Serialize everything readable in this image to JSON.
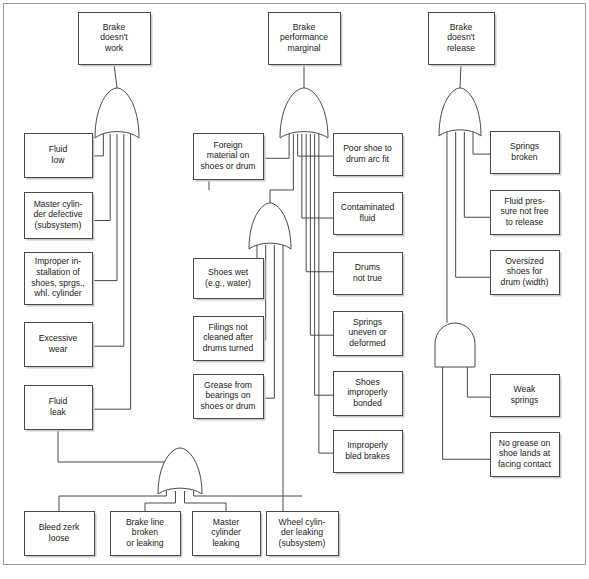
{
  "diagram": {
    "type": "fault-tree",
    "line_color": "#4a4a4a",
    "box_fill": "#ffffff",
    "shadow_color": "#c9c9c9",
    "frame_color": "#9a9a9a"
  },
  "nodes": {
    "top_left": {
      "lines": [
        "Brake",
        "doesn't",
        "work"
      ],
      "x": 78,
      "y": 12,
      "w": 72,
      "h": 52
    },
    "top_mid": {
      "lines": [
        "Brake",
        "performance",
        "marginal"
      ],
      "x": 268,
      "y": 12,
      "w": 72,
      "h": 52
    },
    "top_right": {
      "lines": [
        "Brake",
        "doesn't",
        "release"
      ],
      "x": 428,
      "y": 12,
      "w": 66,
      "h": 52
    },
    "fluid_low": {
      "lines": [
        "Fluid",
        "low"
      ],
      "x": 24,
      "y": 133,
      "w": 68,
      "h": 44
    },
    "master_cyl_defective": {
      "lines": [
        "Master cylin-",
        "der defective",
        "(subsystem)"
      ],
      "x": 24,
      "y": 192,
      "w": 68,
      "h": 46
    },
    "improper_install": {
      "lines": [
        "Improper in-",
        "stallation of",
        "shoes, sprgs.,",
        "whl. cylinder"
      ],
      "x": 24,
      "y": 252,
      "w": 68,
      "h": 52
    },
    "excessive_wear": {
      "lines": [
        "Excessive",
        "wear"
      ],
      "x": 24,
      "y": 322,
      "w": 68,
      "h": 44
    },
    "fluid_leak": {
      "lines": [
        "Fluid",
        "leak"
      ],
      "x": 24,
      "y": 385,
      "w": 68,
      "h": 44
    },
    "foreign_material": {
      "lines": [
        "Foreign",
        "material on",
        "shoes or drum"
      ],
      "x": 193,
      "y": 133,
      "w": 70,
      "h": 46
    },
    "shoes_wet": {
      "lines": [
        "Shoes wet",
        "(e.g., water)"
      ],
      "x": 193,
      "y": 258,
      "w": 70,
      "h": 40
    },
    "filings_not_cleaned": {
      "lines": [
        "Filings not",
        "cleaned after",
        "drums turned"
      ],
      "x": 193,
      "y": 316,
      "w": 70,
      "h": 44
    },
    "grease_bearings": {
      "lines": [
        "Grease from",
        "bearings on",
        "shoes or drum"
      ],
      "x": 193,
      "y": 374,
      "w": 70,
      "h": 44
    },
    "poor_shoe_arc": {
      "lines": [
        "Poor shoe to",
        "drum arc fit"
      ],
      "x": 333,
      "y": 133,
      "w": 69,
      "h": 42
    },
    "contaminated_fluid": {
      "lines": [
        "Contaminated",
        "fluid"
      ],
      "x": 333,
      "y": 192,
      "w": 69,
      "h": 42
    },
    "drums_not_true": {
      "lines": [
        "Drums",
        "not true"
      ],
      "x": 333,
      "y": 252,
      "w": 69,
      "h": 42
    },
    "springs_uneven": {
      "lines": [
        "Springs",
        "uneven or",
        "deformed"
      ],
      "x": 333,
      "y": 311,
      "w": 69,
      "h": 44
    },
    "shoes_improperly_bonded": {
      "lines": [
        "Shoes",
        "improperly",
        "bonded"
      ],
      "x": 333,
      "y": 371,
      "w": 69,
      "h": 44
    },
    "improperly_bled": {
      "lines": [
        "Improperly",
        "bled brakes"
      ],
      "x": 333,
      "y": 430,
      "w": 69,
      "h": 42
    },
    "springs_broken": {
      "lines": [
        "Springs",
        "broken"
      ],
      "x": 490,
      "y": 131,
      "w": 69,
      "h": 42
    },
    "fluid_pressure": {
      "lines": [
        "Fluid pres-",
        "sure not free",
        "to release"
      ],
      "x": 490,
      "y": 190,
      "w": 69,
      "h": 44
    },
    "oversized_shoes": {
      "lines": [
        "Oversized",
        "shoes for",
        "drum (width)"
      ],
      "x": 490,
      "y": 250,
      "w": 69,
      "h": 44
    },
    "weak_springs": {
      "lines": [
        "Weak",
        "springs"
      ],
      "x": 490,
      "y": 374,
      "w": 69,
      "h": 42
    },
    "no_grease": {
      "lines": [
        "No grease on",
        "shoe lands at",
        "facing contact"
      ],
      "x": 490,
      "y": 432,
      "w": 69,
      "h": 44
    },
    "bleed_zerk": {
      "lines": [
        "Bleed zerk",
        "loose"
      ],
      "x": 24,
      "y": 511,
      "w": 70,
      "h": 44
    },
    "brake_line": {
      "lines": [
        "Brake line",
        "broken",
        "or leaking"
      ],
      "x": 110,
      "y": 511,
      "w": 70,
      "h": 44
    },
    "master_cyl_leaking": {
      "lines": [
        "Master",
        "cylinder",
        "leaking"
      ],
      "x": 192,
      "y": 511,
      "w": 68,
      "h": 44
    },
    "wheel_cyl_leaking": {
      "lines": [
        "Wheel cylin-",
        "der leaking",
        "(subsystem)"
      ],
      "x": 266,
      "y": 511,
      "w": 72,
      "h": 44
    }
  },
  "gates": {
    "or_left_top": {
      "kind": "or",
      "cx": 117,
      "top": 88,
      "w": 44,
      "h": 50,
      "inputs": 5
    },
    "or_mid_top": {
      "kind": "or",
      "cx": 304,
      "top": 88,
      "w": 48,
      "h": 50,
      "inputs": 8
    },
    "or_mid_sub": {
      "cx": 270,
      "kind": "or",
      "top": 203,
      "w": 42,
      "h": 46,
      "inputs": 4
    },
    "or_right_top": {
      "kind": "or",
      "cx": 460,
      "top": 88,
      "w": 42,
      "h": 48,
      "inputs": 4
    },
    "and_right": {
      "kind": "and",
      "cx": 455,
      "top": 323,
      "w": 40,
      "h": 44,
      "inputs": 2
    },
    "or_bottom": {
      "kind": "or",
      "cx": 180,
      "top": 448,
      "w": 44,
      "h": 46,
      "inputs": 4
    }
  },
  "labels": {
    "gate_or": "OR gate",
    "gate_and": "AND gate"
  }
}
